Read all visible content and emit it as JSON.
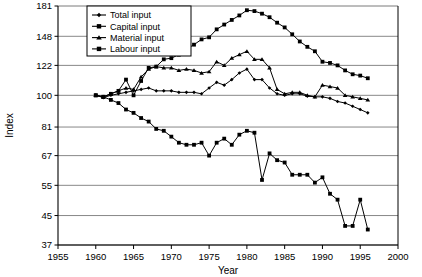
{
  "chart_data": {
    "type": "line",
    "title": "",
    "xlabel": "Year",
    "ylabel": "Index",
    "xlim": [
      1955,
      2000
    ],
    "ylim": [
      37,
      181
    ],
    "yscale": "log",
    "grid": true,
    "legend_position": "top-left",
    "xticks": [
      1955,
      1960,
      1965,
      1970,
      1975,
      1980,
      1985,
      1990,
      1995,
      2000
    ],
    "yticks": [
      37,
      45,
      55,
      67,
      81,
      100,
      122,
      148,
      181
    ],
    "x": [
      1960,
      1961,
      1962,
      1963,
      1964,
      1965,
      1966,
      1967,
      1968,
      1969,
      1970,
      1971,
      1972,
      1973,
      1974,
      1975,
      1976,
      1977,
      1978,
      1979,
      1980,
      1981,
      1982,
      1983,
      1984,
      1985,
      1986,
      1987,
      1988,
      1989,
      1990,
      1991,
      1992,
      1993,
      1994,
      1995,
      1996
    ],
    "series": [
      {
        "name": "Total input",
        "marker": "diamond",
        "color": "#000000",
        "values": [
          100,
          98.5,
          100,
          101,
          102,
          103,
          104,
          105,
          103,
          103,
          103,
          102,
          102,
          102,
          101,
          105,
          109,
          107,
          111,
          116,
          119,
          111,
          111,
          105,
          101,
          100,
          101,
          101,
          99.5,
          99,
          99,
          98,
          96,
          95,
          93,
          91,
          89
        ]
      },
      {
        "name": "Capital input",
        "marker": "square",
        "color": "#000000",
        "values": [
          100,
          99,
          101,
          103,
          111,
          100,
          110,
          120,
          121,
          127,
          128,
          131,
          136,
          140,
          145,
          147,
          155,
          160,
          165,
          170,
          176,
          175,
          172,
          168,
          162,
          157,
          150,
          143,
          138,
          134,
          125,
          124,
          122,
          118,
          115,
          114,
          112
        ]
      },
      {
        "name": "Material input",
        "marker": "triangle",
        "color": "#000000",
        "values": [
          100,
          99,
          101,
          103,
          105,
          104,
          113,
          119,
          121,
          120,
          120,
          118,
          119,
          118,
          116,
          117,
          125,
          122,
          128,
          131,
          134,
          127,
          127,
          120,
          104,
          101,
          102,
          102,
          100,
          99,
          107,
          106,
          105,
          100,
          99,
          98,
          97
        ]
      },
      {
        "name": "Labour input",
        "marker": "square",
        "color": "#000000",
        "values": [
          100,
          99,
          97,
          95,
          91,
          89,
          86,
          84,
          80,
          79,
          76,
          73,
          72,
          72,
          73,
          67,
          73,
          75,
          72,
          77,
          79,
          78,
          57,
          68,
          65,
          64,
          59,
          59,
          59,
          56,
          58,
          52,
          50,
          42,
          42,
          50,
          41
        ]
      }
    ]
  }
}
